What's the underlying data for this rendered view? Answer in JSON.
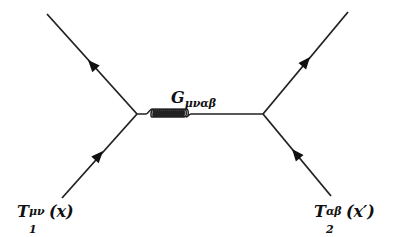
{
  "diagram": {
    "type": "feynman-diagram",
    "propagator": {
      "kind": "gluon/graviton (curly line)",
      "label": "G",
      "label_sub": "μναβ"
    },
    "vertices": [
      {
        "id": "left",
        "x": 137,
        "y": 114
      },
      {
        "id": "right",
        "x": 263,
        "y": 114
      }
    ],
    "external_lines": [
      {
        "id": "top-left",
        "from": [
          47,
          14
        ],
        "to": [
          137,
          114
        ],
        "arrow": "toward top-left"
      },
      {
        "id": "bottom-left",
        "from": [
          62,
          198
        ],
        "to": [
          137,
          114
        ],
        "arrow": "toward vertex"
      },
      {
        "id": "top-right",
        "from": [
          263,
          114
        ],
        "to": [
          348,
          12
        ],
        "arrow": "toward top-right"
      },
      {
        "id": "bottom-right",
        "from": [
          331,
          196
        ],
        "to": [
          263,
          114
        ],
        "arrow": "toward vertex"
      }
    ],
    "sources": [
      {
        "id": "T1",
        "symbol": "T",
        "sub": "1",
        "sup": "μν",
        "arg": "(x)"
      },
      {
        "id": "T2",
        "symbol": "T",
        "sub": "2",
        "sup": "αβ",
        "arg": "(x′)"
      }
    ]
  }
}
